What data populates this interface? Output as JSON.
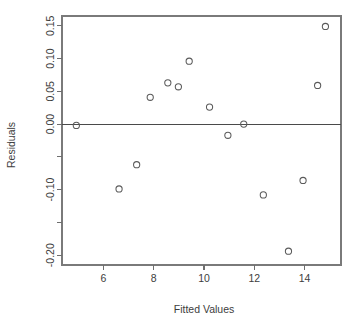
{
  "chart_data": {
    "type": "scatter",
    "title": "",
    "xlabel": "Fitted Values",
    "ylabel": "Residuals",
    "xlim": [
      4.35,
      15.45
    ],
    "ylim": [
      -0.215,
      0.165
    ],
    "grid": false,
    "legend": null,
    "xticks": [
      6,
      10,
      12,
      14
    ],
    "xtick_labels": [
      "6",
      "8",
      "10",
      "12",
      "14"
    ],
    "xtick_values": [
      6,
      8,
      10,
      12,
      14
    ],
    "ytick_values": [
      0.15,
      0.1,
      0.05,
      0.0,
      -0.05,
      -0.1,
      -0.15,
      -0.2
    ],
    "ytick_labels": [
      "0.15",
      "0.10",
      "0.05",
      "0.00",
      "",
      "-0.10",
      "",
      "-0.20"
    ],
    "reference_line": {
      "orientation": "horizontal",
      "y": 0.0
    },
    "marker": "open-circle",
    "x": [
      4.92,
      6.62,
      7.32,
      7.86,
      8.56,
      8.98,
      9.41,
      10.22,
      10.95,
      11.58,
      12.36,
      13.36,
      13.94,
      14.52,
      14.83
    ],
    "y": [
      -0.002,
      -0.099,
      -0.062,
      0.041,
      0.063,
      0.057,
      0.096,
      0.026,
      -0.017,
      0.0,
      -0.108,
      -0.194,
      -0.086,
      0.059,
      0.149
    ],
    "points": [
      {
        "x": 4.92,
        "y": -0.002
      },
      {
        "x": 6.62,
        "y": -0.099
      },
      {
        "x": 7.32,
        "y": -0.062
      },
      {
        "x": 7.86,
        "y": 0.041
      },
      {
        "x": 8.56,
        "y": 0.063
      },
      {
        "x": 8.98,
        "y": 0.057
      },
      {
        "x": 9.41,
        "y": 0.096
      },
      {
        "x": 10.22,
        "y": 0.026
      },
      {
        "x": 10.95,
        "y": -0.017
      },
      {
        "x": 11.58,
        "y": 0.0
      },
      {
        "x": 12.36,
        "y": -0.108
      },
      {
        "x": 13.36,
        "y": -0.194
      },
      {
        "x": 13.94,
        "y": -0.086
      },
      {
        "x": 14.52,
        "y": 0.059
      },
      {
        "x": 14.83,
        "y": 0.149
      }
    ],
    "colors": {
      "marker_stroke": "#5a5a5a",
      "axis": "#6e6e6e",
      "zero_line": "#4a4a4a",
      "text": "#3d3d3d",
      "background": "#ffffff"
    }
  }
}
